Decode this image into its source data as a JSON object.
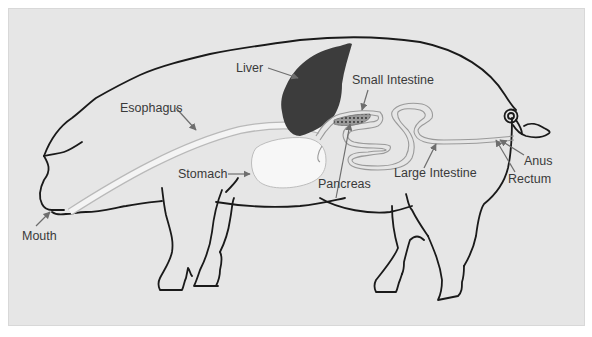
{
  "diagram": {
    "colors": {
      "background": "#e6e6e6",
      "outline": "#1a1a1a",
      "liver": "#3c3c3c",
      "stomach": "#f7f7f7",
      "tube": "#f2f2f2",
      "pointer": "#6e6e6e",
      "label_text": "#3a3a3a"
    },
    "labels": {
      "liver": "Liver",
      "small_intestine": "Small Intestine",
      "esophagus": "Esophagus",
      "stomach": "Stomach",
      "pancreas": "Pancreas",
      "large_intestine": "Large Intestine",
      "anus": "Anus",
      "rectum": "Rectum",
      "mouth": "Mouth"
    }
  }
}
